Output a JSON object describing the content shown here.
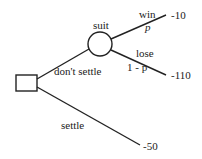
{
  "diagram": {
    "type": "decision-tree",
    "nodes": {
      "decision": {
        "shape": "square"
      },
      "chance": {
        "shape": "circle",
        "label": "suit"
      }
    },
    "branches": {
      "dont_settle": {
        "label": "don't settle"
      },
      "settle": {
        "label": "settle",
        "payoff": "-50"
      },
      "win": {
        "label": "win",
        "probability": "p",
        "payoff": "-10"
      },
      "lose": {
        "label": "lose",
        "probability": "1 - p",
        "payoff": "-110"
      }
    }
  }
}
